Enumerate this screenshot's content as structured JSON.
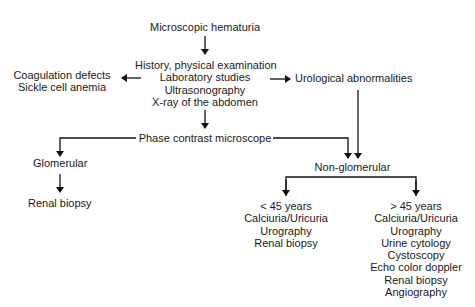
{
  "diagram": {
    "type": "flowchart",
    "nodes": {
      "start": {
        "text": "Microscopic hematuria"
      },
      "workup": {
        "lines": [
          "History, physical examination",
          "Laboratory studies",
          "Ultrasonography",
          "X-ray of the abdomen"
        ]
      },
      "hematologic": {
        "lines": [
          "Coagulation defects",
          "Sickle cell anemia"
        ]
      },
      "urological": {
        "text": "Urological abnormalities"
      },
      "phase": {
        "text": "Phase contrast microscope"
      },
      "glomerular": {
        "text": "Glomerular"
      },
      "glom_biopsy": {
        "text": "Renal biopsy"
      },
      "nonglom": {
        "text": "Non-glomerular"
      },
      "under45": {
        "lines": [
          "< 45 years",
          "Calciuria/Uricuria",
          "Urography",
          "Renal biopsy"
        ]
      },
      "over45": {
        "lines": [
          "> 45 years",
          "Calciuria/Uricuria",
          "Urography",
          "Urine cytology",
          "Cystoscopy",
          "Echo color doppler",
          "Renal biopsy",
          "Angiography"
        ]
      }
    },
    "edges": [
      {
        "from": "start",
        "to": "workup"
      },
      {
        "from": "workup",
        "to": "hematologic"
      },
      {
        "from": "workup",
        "to": "urological"
      },
      {
        "from": "workup",
        "to": "phase"
      },
      {
        "from": "phase",
        "to": "glomerular"
      },
      {
        "from": "phase",
        "to": "nonglom"
      },
      {
        "from": "urological",
        "to": "nonglom"
      },
      {
        "from": "glomerular",
        "to": "glom_biopsy"
      },
      {
        "from": "nonglom",
        "to": "under45"
      },
      {
        "from": "nonglom",
        "to": "over45"
      }
    ],
    "colors": {
      "line": "#111111",
      "text": "#1a1a1a",
      "background": "#ffffff"
    }
  }
}
